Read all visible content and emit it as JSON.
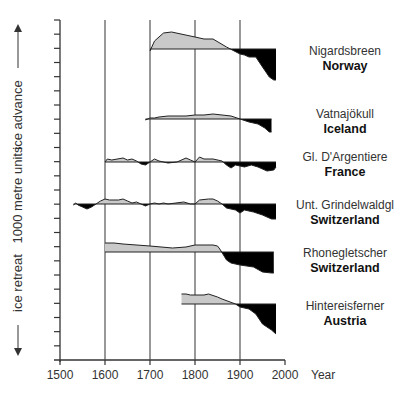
{
  "chart_data": {
    "type": "area",
    "title": "",
    "xlabel": "Year",
    "ylabel": "1000 metre units",
    "y_axis_annotations": {
      "top": "ice advance",
      "bottom": "ice retreat"
    },
    "xlim": [
      1500,
      2000
    ],
    "x_ticks": [
      1500,
      1600,
      1700,
      1800,
      1900,
      2000
    ],
    "y_tick_count": 25,
    "grid": {
      "vertical_lines_at": [
        1600,
        1700,
        1800,
        1900
      ]
    },
    "legend": "none",
    "note": "Each glacier is drawn as its own offset series around a baseline; positive (advance) shaded light grey, negative (retreat) shaded black. Values are relative length in approx. 1000 m units.",
    "series": [
      {
        "name": "Nigardsbreen",
        "country": "Norway",
        "baseline_y": 49,
        "points": [
          [
            1700,
            -0.2
          ],
          [
            1710,
            0.8
          ],
          [
            1730,
            1.6
          ],
          [
            1748,
            1.7
          ],
          [
            1800,
            1.2
          ],
          [
            1820,
            1.0
          ],
          [
            1840,
            1.0
          ],
          [
            1870,
            0.2
          ],
          [
            1900,
            -0.5
          ],
          [
            1910,
            -0.6
          ],
          [
            1920,
            -0.8
          ],
          [
            1935,
            -0.8
          ],
          [
            1950,
            -1.8
          ],
          [
            1965,
            -2.8
          ],
          [
            1975,
            -3.1
          ],
          [
            1980,
            -3.1
          ]
        ]
      },
      {
        "name": "Vatnajökull",
        "country": "Iceland",
        "baseline_y": 119,
        "points": [
          [
            1690,
            -0.1
          ],
          [
            1700,
            0.1
          ],
          [
            1710,
            0.1
          ],
          [
            1720,
            0.2
          ],
          [
            1740,
            0.3
          ],
          [
            1760,
            0.3
          ],
          [
            1780,
            0.3
          ],
          [
            1800,
            0.4
          ],
          [
            1820,
            0.4
          ],
          [
            1840,
            0.5
          ],
          [
            1860,
            0.4
          ],
          [
            1880,
            0.3
          ],
          [
            1900,
            0.0
          ],
          [
            1920,
            -0.3
          ],
          [
            1940,
            -0.5
          ],
          [
            1955,
            -0.9
          ],
          [
            1965,
            -1.3
          ],
          [
            1970,
            -1.3
          ]
        ]
      },
      {
        "name": "Gl. D'Argentiere",
        "country": "France",
        "baseline_y": 162,
        "points": [
          [
            1600,
            0
          ],
          [
            1605,
            0.3
          ],
          [
            1615,
            0.2
          ],
          [
            1640,
            0.4
          ],
          [
            1650,
            0.2
          ],
          [
            1660,
            0.3
          ],
          [
            1670,
            0.1
          ],
          [
            1680,
            -0.2
          ],
          [
            1690,
            -0.3
          ],
          [
            1700,
            0
          ],
          [
            1710,
            0.3
          ],
          [
            1720,
            0.1
          ],
          [
            1740,
            -0.1
          ],
          [
            1760,
            0
          ],
          [
            1780,
            0.4
          ],
          [
            1790,
            0.2
          ],
          [
            1800,
            0
          ],
          [
            1810,
            0.5
          ],
          [
            1820,
            0.3
          ],
          [
            1840,
            0.3
          ],
          [
            1860,
            0.1
          ],
          [
            1870,
            -0.3
          ],
          [
            1880,
            -0.6
          ],
          [
            1890,
            -0.3
          ],
          [
            1910,
            -0.5
          ],
          [
            1925,
            -0.3
          ],
          [
            1940,
            -0.5
          ],
          [
            1960,
            -0.9
          ],
          [
            1975,
            -0.8
          ],
          [
            1980,
            -0.5
          ]
        ]
      },
      {
        "name": "Unt. Grindelwaldgl",
        "country": "Switzerland",
        "baseline_y": 204,
        "points": [
          [
            1530,
            -0.1
          ],
          [
            1535,
            0.1
          ],
          [
            1540,
            -0.1
          ],
          [
            1550,
            -0.3
          ],
          [
            1560,
            -0.5
          ],
          [
            1570,
            -0.3
          ],
          [
            1580,
            0
          ],
          [
            1590,
            0.3
          ],
          [
            1600,
            0.5
          ],
          [
            1610,
            0.4
          ],
          [
            1630,
            0.4
          ],
          [
            1640,
            0.5
          ],
          [
            1650,
            0.3
          ],
          [
            1660,
            0.1
          ],
          [
            1670,
            0.2
          ],
          [
            1680,
            0
          ],
          [
            1690,
            -0.2
          ],
          [
            1700,
            0
          ],
          [
            1710,
            0.1
          ],
          [
            1720,
            0
          ],
          [
            1730,
            0.1
          ],
          [
            1740,
            0
          ],
          [
            1775,
            0.2
          ],
          [
            1790,
            0
          ],
          [
            1800,
            0
          ],
          [
            1810,
            0.4
          ],
          [
            1830,
            0.5
          ],
          [
            1840,
            0.5
          ],
          [
            1850,
            0.3
          ],
          [
            1860,
            0
          ],
          [
            1870,
            -0.4
          ],
          [
            1890,
            -0.6
          ],
          [
            1900,
            -0.9
          ],
          [
            1910,
            -0.6
          ],
          [
            1930,
            -0.8
          ],
          [
            1950,
            -1.1
          ],
          [
            1970,
            -1.5
          ],
          [
            1980,
            -1.5
          ]
        ]
      },
      {
        "name": "Rhonegletscher",
        "country": "Switzerland",
        "baseline_y": 252,
        "points": [
          [
            1600,
            0.9
          ],
          [
            1620,
            0.9
          ],
          [
            1640,
            0.8
          ],
          [
            1700,
            0.6
          ],
          [
            1750,
            0.4
          ],
          [
            1780,
            0.5
          ],
          [
            1800,
            0.7
          ],
          [
            1820,
            0.7
          ],
          [
            1840,
            0.7
          ],
          [
            1850,
            0.6
          ],
          [
            1855,
            0.3
          ],
          [
            1870,
            -0.8
          ],
          [
            1880,
            -1.1
          ],
          [
            1900,
            -1.3
          ],
          [
            1930,
            -1.5
          ],
          [
            1950,
            -2.0
          ],
          [
            1970,
            -2.1
          ],
          [
            1975,
            -2.1
          ]
        ]
      },
      {
        "name": "Hintereisferner",
        "country": "Austria",
        "baseline_y": 304,
        "points": [
          [
            1770,
            1.0
          ],
          [
            1780,
            1.0
          ],
          [
            1790,
            0.9
          ],
          [
            1800,
            0.9
          ],
          [
            1820,
            0.9
          ],
          [
            1830,
            1.0
          ],
          [
            1850,
            0.7
          ],
          [
            1860,
            0.5
          ],
          [
            1890,
            0
          ],
          [
            1900,
            -0.3
          ],
          [
            1920,
            -0.5
          ],
          [
            1935,
            -1.0
          ],
          [
            1950,
            -2.0
          ],
          [
            1970,
            -2.6
          ],
          [
            1980,
            -3.0
          ]
        ]
      }
    ]
  },
  "axes": {
    "y_label": "1000 metre units",
    "y_top_annotation": "ice advance",
    "y_bottom_annotation": "ice retreat",
    "x_title": "Year",
    "x_tick_labels": [
      "1500",
      "1600",
      "1700",
      "1800",
      "1900",
      "2000"
    ]
  },
  "labels": [
    {
      "name": "Nigardsbreen",
      "country": "Norway"
    },
    {
      "name": "Vatnajökull",
      "country": "Iceland"
    },
    {
      "name": "Gl. D'Argentiere",
      "country": "France"
    },
    {
      "name": "Unt. Grindelwaldgl",
      "country": "Switzerland"
    },
    {
      "name": "Rhonegletscher",
      "country": "Switzerland"
    },
    {
      "name": "Hintereisferner",
      "country": "Austria"
    }
  ],
  "colors": {
    "advance_fill": "#c9c9c9",
    "retreat_fill": "#000000",
    "line": "#333333"
  }
}
